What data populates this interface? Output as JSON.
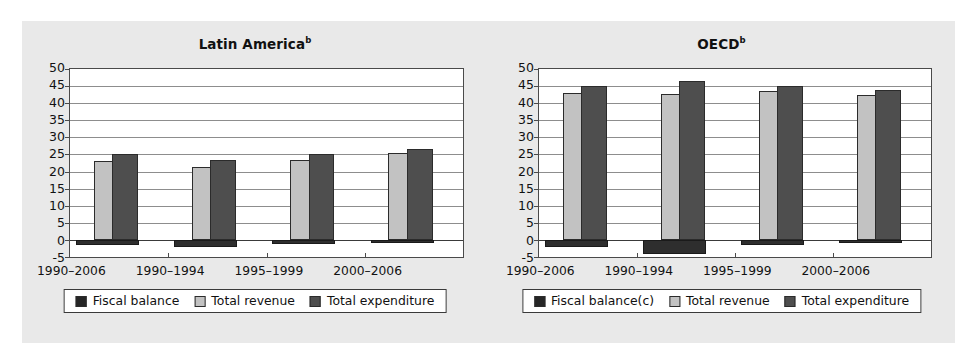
{
  "figure": {
    "background_color": "#e9e9e9",
    "panel_background": "#ffffff"
  },
  "colors": {
    "fiscal_balance": "#262626",
    "total_revenue": "#c2c2c2",
    "total_expenditure": "#4e4e4e",
    "axis": "#4a4a4a",
    "gridline": "#8d8d8d"
  },
  "charts": [
    {
      "id": "latin-america",
      "title": "Latin America",
      "title_superscript": "b",
      "legend": [
        {
          "key": "balance",
          "label": "Fiscal balance"
        },
        {
          "key": "revenue",
          "label": "Total revenue"
        },
        {
          "key": "expenditure",
          "label": "Total expenditure"
        }
      ]
    },
    {
      "id": "oecd",
      "title": "OECD",
      "title_superscript": "b",
      "legend": [
        {
          "key": "balance",
          "label": "Fiscal balance(c)"
        },
        {
          "key": "revenue",
          "label": "Total revenue"
        },
        {
          "key": "expenditure",
          "label": "Total expenditure"
        }
      ]
    }
  ],
  "chart_data": [
    {
      "type": "bar",
      "id": "latin-america",
      "title": "Latin America",
      "title_superscript": "b",
      "xlabel": "",
      "ylabel": "",
      "ylim": [
        -5,
        50
      ],
      "yticks": [
        -5,
        0,
        5,
        10,
        15,
        20,
        25,
        30,
        35,
        40,
        45,
        50
      ],
      "ytick_labels": [
        "-5",
        "0",
        "5",
        "10",
        "15",
        "20",
        "25",
        "30",
        "35",
        "40",
        "45",
        "50"
      ],
      "grid": true,
      "legend_position": "below",
      "categories": [
        "1990–2006",
        "1990–1994",
        "1995–1999",
        "2000–2006"
      ],
      "series": [
        {
          "name": "Fiscal balance",
          "key": "balance",
          "color": "#262626",
          "values": [
            -1.5,
            -2.0,
            -1.3,
            -1.0
          ]
        },
        {
          "name": "Total revenue",
          "key": "revenue",
          "color": "#c2c2c2",
          "values": [
            23.0,
            21.3,
            23.5,
            25.3
          ]
        },
        {
          "name": "Total expenditure",
          "key": "expenditure",
          "color": "#4e4e4e",
          "values": [
            25.2,
            23.5,
            25.0,
            26.5
          ]
        }
      ]
    },
    {
      "type": "bar",
      "id": "oecd",
      "title": "OECD",
      "title_superscript": "b",
      "xlabel": "",
      "ylabel": "",
      "ylim": [
        -5,
        50
      ],
      "yticks": [
        -5,
        0,
        5,
        10,
        15,
        20,
        25,
        30,
        35,
        40,
        45,
        50
      ],
      "ytick_labels": [
        "-5",
        "0",
        "5",
        "10",
        "15",
        "20",
        "25",
        "30",
        "35",
        "40",
        "45",
        "50"
      ],
      "grid": true,
      "legend_position": "below",
      "categories": [
        "1990–2006",
        "1990–1994",
        "1995–1999",
        "2000–2006"
      ],
      "series": [
        {
          "name": "Fiscal balance(c)",
          "key": "balance",
          "color": "#262626",
          "values": [
            -2.0,
            -4.0,
            -1.5,
            -0.8
          ]
        },
        {
          "name": "Total revenue",
          "key": "revenue",
          "color": "#c2c2c2",
          "values": [
            43.0,
            42.7,
            43.7,
            42.5
          ]
        },
        {
          "name": "Total expenditure",
          "key": "expenditure",
          "color": "#4e4e4e",
          "values": [
            45.0,
            46.5,
            45.0,
            43.8
          ]
        }
      ]
    }
  ]
}
